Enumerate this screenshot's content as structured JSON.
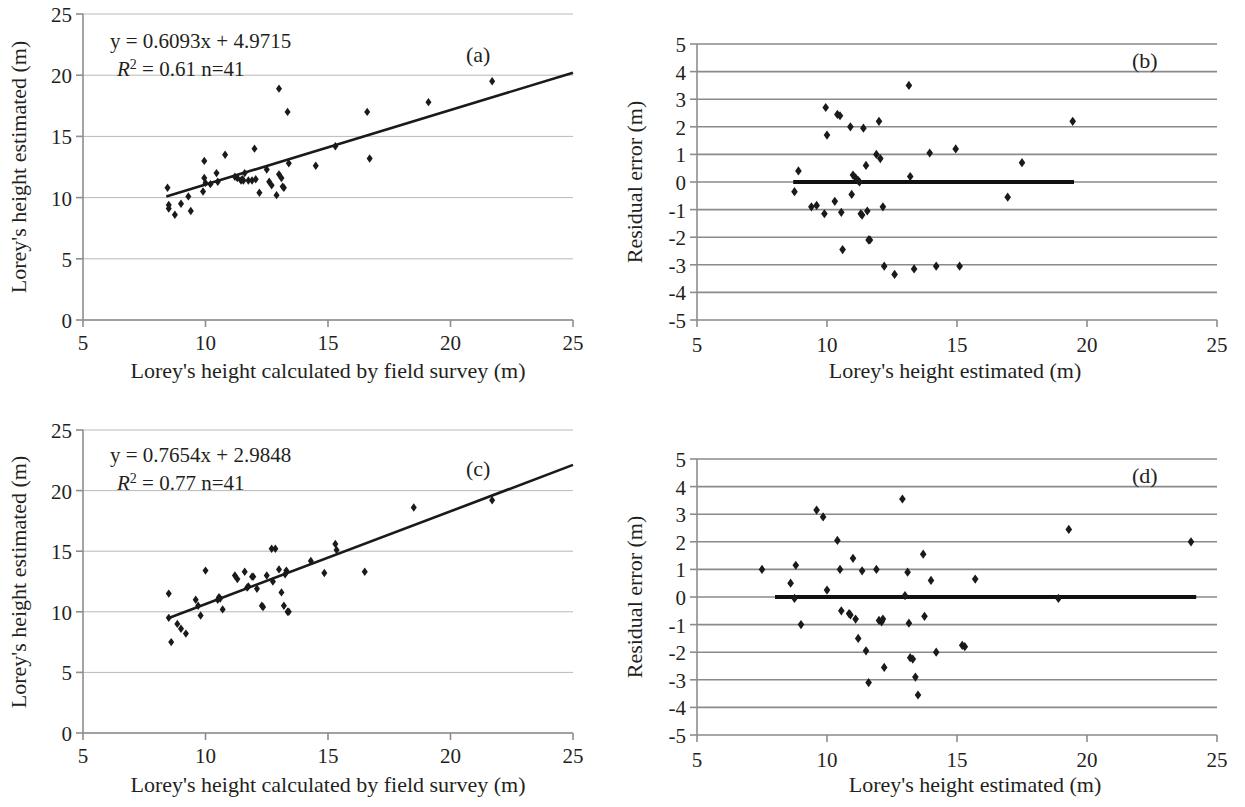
{
  "figure": {
    "background": "#ffffff",
    "marker_color": "#1a1a1a",
    "grid_color": "#b9b9b9",
    "axis_color": "#8d8d8d"
  },
  "panels": {
    "a": {
      "tag": "(a)",
      "equation_line1": "y = 0.6093x + 4.9715",
      "equation_r2_prefix": "R",
      "equation_r2_sup": "2",
      "equation_line2": " = 0.61  n=41",
      "xlabel": "Lorey's height calculated by field survey (m)",
      "ylabel": "Lorey's height estimated (m)",
      "xticks": [
        "5",
        "10",
        "15",
        "20",
        "25"
      ],
      "yticks": [
        "0",
        "5",
        "10",
        "15",
        "20",
        "25"
      ]
    },
    "b": {
      "tag": "(b)",
      "xlabel": "Lorey's height estimated (m)",
      "ylabel": "Residual error (m)",
      "xticks": [
        "5",
        "10",
        "15",
        "20",
        "25"
      ],
      "yticks": [
        "5",
        "4",
        "3",
        "2",
        "1",
        "0",
        "-1",
        "-2",
        "-3",
        "-4",
        "-5"
      ]
    },
    "c": {
      "tag": "(c)",
      "equation_line1": "y = 0.7654x + 2.9848",
      "equation_r2_prefix": "R",
      "equation_r2_sup": "2",
      "equation_line2": " = 0.77    n=41",
      "xlabel": "Lorey's height calculated by field survey (m)",
      "ylabel": "Lorey's height estimated (m)",
      "xticks": [
        "5",
        "10",
        "15",
        "20",
        "25"
      ],
      "yticks": [
        "0",
        "5",
        "10",
        "15",
        "20",
        "25"
      ]
    },
    "d": {
      "tag": "(d)",
      "xlabel": "Lorey's height estimated (m)",
      "ylabel": "Residual error (m)",
      "xticks": [
        "5",
        "10",
        "15",
        "20",
        "25"
      ],
      "yticks": [
        "5",
        "4",
        "3",
        "2",
        "1",
        "0",
        "-1",
        "-2",
        "-3",
        "-4",
        "-5"
      ]
    }
  },
  "chart_data": [
    {
      "id": "a",
      "type": "scatter",
      "title": "(a)",
      "xlabel": "Lorey's height calculated by field survey (m)",
      "ylabel": "Lorey's height estimated (m)",
      "xlim": [
        5,
        25
      ],
      "ylim": [
        0,
        25
      ],
      "xticks": [
        5,
        10,
        15,
        20,
        25
      ],
      "yticks": [
        0,
        5,
        10,
        15,
        20,
        25
      ],
      "grid": "horizontal",
      "legend": "none",
      "annotations": [
        "y = 0.6093x + 4.9715",
        "R2 = 0.61  n=41"
      ],
      "fit": {
        "type": "linear",
        "slope": 0.6093,
        "intercept": 4.9715,
        "r2": 0.61,
        "n": 41,
        "x_start": 8.4,
        "x_end": 25.0
      },
      "points": [
        [
          8.45,
          10.8
        ],
        [
          8.5,
          9.4
        ],
        [
          8.5,
          9.1
        ],
        [
          8.75,
          8.6
        ],
        [
          9.0,
          9.5
        ],
        [
          9.3,
          10.1
        ],
        [
          9.4,
          8.9
        ],
        [
          9.95,
          13.0
        ],
        [
          9.95,
          11.6
        ],
        [
          9.9,
          10.5
        ],
        [
          10.0,
          11.2
        ],
        [
          10.2,
          11.1
        ],
        [
          10.45,
          12.0
        ],
        [
          10.5,
          11.3
        ],
        [
          10.8,
          13.5
        ],
        [
          11.2,
          11.7
        ],
        [
          11.3,
          11.6
        ],
        [
          11.45,
          11.4
        ],
        [
          11.5,
          11.5
        ],
        [
          11.55,
          11.4
        ],
        [
          11.6,
          12.0
        ],
        [
          11.75,
          11.4
        ],
        [
          11.9,
          11.4
        ],
        [
          12.0,
          14.0
        ],
        [
          12.05,
          11.5
        ],
        [
          12.2,
          10.4
        ],
        [
          12.5,
          12.3
        ],
        [
          12.6,
          11.3
        ],
        [
          12.7,
          11.0
        ],
        [
          12.9,
          10.2
        ],
        [
          13.0,
          18.9
        ],
        [
          13.0,
          11.9
        ],
        [
          13.1,
          11.6
        ],
        [
          13.15,
          10.9
        ],
        [
          13.2,
          10.8
        ],
        [
          13.35,
          17.0
        ],
        [
          13.4,
          12.8
        ],
        [
          14.5,
          12.6
        ],
        [
          15.3,
          14.2
        ],
        [
          16.6,
          17.0
        ],
        [
          16.7,
          13.2
        ],
        [
          19.1,
          17.8
        ],
        [
          21.7,
          19.5
        ]
      ]
    },
    {
      "id": "b",
      "type": "scatter",
      "title": "(b)",
      "xlabel": "Lorey's height estimated (m)",
      "ylabel": "Residual error (m)",
      "xlim": [
        5,
        25
      ],
      "ylim": [
        -5,
        5
      ],
      "xticks": [
        5,
        10,
        15,
        20,
        25
      ],
      "yticks": [
        5,
        4,
        3,
        2,
        1,
        0,
        -1,
        -2,
        -3,
        -4,
        -5
      ],
      "grid": "horizontal",
      "legend": "none",
      "reference_line": {
        "y": 0,
        "x_start": 8.7,
        "x_end": 19.5
      },
      "points": [
        [
          8.9,
          0.4
        ],
        [
          8.75,
          -0.35
        ],
        [
          9.4,
          -0.9
        ],
        [
          9.6,
          -0.85
        ],
        [
          9.9,
          -1.15
        ],
        [
          9.95,
          2.7
        ],
        [
          10.0,
          1.7
        ],
        [
          10.3,
          -0.7
        ],
        [
          10.4,
          2.45
        ],
        [
          10.5,
          2.4
        ],
        [
          10.55,
          -1.1
        ],
        [
          10.6,
          -2.45
        ],
        [
          10.9,
          2.0
        ],
        [
          10.95,
          -0.45
        ],
        [
          11.0,
          0.25
        ],
        [
          11.1,
          0.15
        ],
        [
          11.2,
          0.05
        ],
        [
          11.25,
          0.0
        ],
        [
          11.3,
          -1.15
        ],
        [
          11.35,
          -1.2
        ],
        [
          11.4,
          1.95
        ],
        [
          11.5,
          0.6
        ],
        [
          11.55,
          -1.05
        ],
        [
          11.6,
          -2.1
        ],
        [
          11.65,
          -2.1
        ],
        [
          11.9,
          1.0
        ],
        [
          12.0,
          2.2
        ],
        [
          12.05,
          0.85
        ],
        [
          12.15,
          -0.9
        ],
        [
          12.2,
          -3.05
        ],
        [
          12.6,
          -3.35
        ],
        [
          13.15,
          3.5
        ],
        [
          13.2,
          0.2
        ],
        [
          13.35,
          -3.15
        ],
        [
          13.95,
          1.05
        ],
        [
          14.2,
          -3.05
        ],
        [
          14.95,
          1.2
        ],
        [
          15.1,
          -3.05
        ],
        [
          16.95,
          -0.55
        ],
        [
          17.5,
          0.7
        ],
        [
          19.45,
          2.2
        ]
      ]
    },
    {
      "id": "c",
      "type": "scatter",
      "title": "(c)",
      "xlabel": "Lorey's height calculated by field survey (m)",
      "ylabel": "Lorey's height estimated (m)",
      "xlim": [
        5,
        25
      ],
      "ylim": [
        0,
        25
      ],
      "xticks": [
        5,
        10,
        15,
        20,
        25
      ],
      "yticks": [
        0,
        5,
        10,
        15,
        20,
        25
      ],
      "grid": "horizontal",
      "legend": "none",
      "annotations": [
        "y = 0.7654x + 2.9848",
        "R2 = 0.77    n=41"
      ],
      "fit": {
        "type": "linear",
        "slope": 0.7654,
        "intercept": 2.9848,
        "r2": 0.77,
        "n": 41,
        "x_start": 8.45,
        "x_end": 25.0
      },
      "points": [
        [
          8.5,
          11.5
        ],
        [
          8.5,
          9.5
        ],
        [
          8.6,
          7.5
        ],
        [
          8.85,
          9.0
        ],
        [
          9.0,
          8.6
        ],
        [
          9.2,
          8.2
        ],
        [
          9.6,
          11.0
        ],
        [
          9.7,
          10.5
        ],
        [
          9.8,
          9.7
        ],
        [
          10.0,
          13.4
        ],
        [
          10.5,
          11.0
        ],
        [
          10.55,
          11.2
        ],
        [
          10.6,
          11.1
        ],
        [
          10.7,
          10.2
        ],
        [
          11.2,
          13.0
        ],
        [
          11.3,
          12.7
        ],
        [
          11.6,
          13.3
        ],
        [
          11.7,
          12.0
        ],
        [
          11.75,
          12.1
        ],
        [
          11.9,
          12.9
        ],
        [
          11.95,
          12.9
        ],
        [
          12.1,
          11.9
        ],
        [
          12.3,
          10.5
        ],
        [
          12.35,
          10.4
        ],
        [
          12.5,
          13.0
        ],
        [
          12.7,
          15.2
        ],
        [
          12.75,
          12.5
        ],
        [
          12.85,
          15.2
        ],
        [
          13.0,
          13.5
        ],
        [
          13.1,
          11.6
        ],
        [
          13.2,
          10.5
        ],
        [
          13.25,
          13.1
        ],
        [
          13.3,
          13.4
        ],
        [
          13.35,
          10.0
        ],
        [
          13.4,
          10.0
        ],
        [
          14.3,
          14.2
        ],
        [
          14.85,
          13.2
        ],
        [
          15.3,
          15.6
        ],
        [
          15.35,
          15.1
        ],
        [
          16.5,
          13.3
        ],
        [
          18.5,
          18.6
        ],
        [
          21.7,
          19.2
        ]
      ]
    },
    {
      "id": "d",
      "type": "scatter",
      "title": "(d)",
      "xlabel": "Lorey's height estimated (m)",
      "ylabel": "Residual error (m)",
      "xlim": [
        5,
        25
      ],
      "ylim": [
        -5,
        5
      ],
      "xticks": [
        5,
        10,
        15,
        20,
        25
      ],
      "yticks": [
        5,
        4,
        3,
        2,
        1,
        0,
        -1,
        -2,
        -3,
        -4,
        -5
      ],
      "grid": "horizontal",
      "legend": "none",
      "reference_line": {
        "y": 0,
        "x_start": 8.0,
        "x_end": 24.2
      },
      "points": [
        [
          7.5,
          1.0
        ],
        [
          8.6,
          0.5
        ],
        [
          8.75,
          -0.05
        ],
        [
          8.8,
          1.15
        ],
        [
          9.0,
          -1.0
        ],
        [
          9.6,
          3.15
        ],
        [
          9.85,
          2.9
        ],
        [
          10.0,
          0.25
        ],
        [
          10.4,
          2.05
        ],
        [
          10.5,
          1.0
        ],
        [
          10.55,
          -0.5
        ],
        [
          10.85,
          -0.6
        ],
        [
          10.9,
          -0.65
        ],
        [
          11.0,
          1.4
        ],
        [
          11.1,
          -0.8
        ],
        [
          11.2,
          -1.5
        ],
        [
          11.35,
          0.95
        ],
        [
          11.5,
          -1.95
        ],
        [
          11.6,
          -3.1
        ],
        [
          11.9,
          1.0
        ],
        [
          12.0,
          -0.85
        ],
        [
          12.1,
          -0.9
        ],
        [
          12.15,
          -0.8
        ],
        [
          12.2,
          -2.55
        ],
        [
          12.9,
          3.55
        ],
        [
          13.0,
          0.05
        ],
        [
          13.1,
          0.9
        ],
        [
          13.15,
          -0.95
        ],
        [
          13.2,
          -2.2
        ],
        [
          13.3,
          -2.25
        ],
        [
          13.4,
          -2.9
        ],
        [
          13.5,
          -3.55
        ],
        [
          13.7,
          1.55
        ],
        [
          13.75,
          -0.7
        ],
        [
          14.0,
          0.6
        ],
        [
          14.2,
          -2.0
        ],
        [
          15.2,
          -1.75
        ],
        [
          15.3,
          -1.8
        ],
        [
          15.7,
          0.65
        ],
        [
          18.9,
          -0.05
        ],
        [
          19.3,
          2.45
        ],
        [
          24.0,
          2.0
        ]
      ]
    }
  ]
}
